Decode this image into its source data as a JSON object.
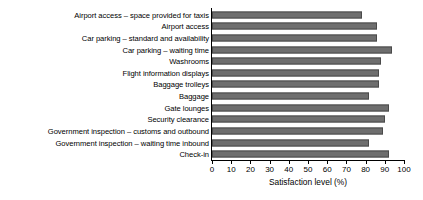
{
  "chart_data": {
    "type": "bar",
    "orientation": "horizontal",
    "title": "",
    "xlabel": "Satisfaction level (%)",
    "ylabel": "",
    "xlim": [
      0,
      100
    ],
    "xticks": [
      0,
      10,
      20,
      30,
      40,
      50,
      60,
      70,
      80,
      90,
      100
    ],
    "grid": false,
    "legend": false,
    "bar_color": "#6e6e6e",
    "bar_edge_color": "#4a4a4a",
    "categories": [
      "Airport access – space provided for taxis",
      "Airport access",
      "Car parking – standard and availability",
      "Car parking – waiting time",
      "Washrooms",
      "Flight information displays",
      "Baggage trolleys",
      "Baggage",
      "Gate lounges",
      "Security clearance",
      "Government inspection – customs and outbound",
      "Government inspection – waiting time inbound",
      "Check-in"
    ],
    "values": [
      78,
      86,
      86,
      94,
      88,
      87,
      87,
      82,
      92,
      90,
      89,
      82,
      92
    ]
  }
}
